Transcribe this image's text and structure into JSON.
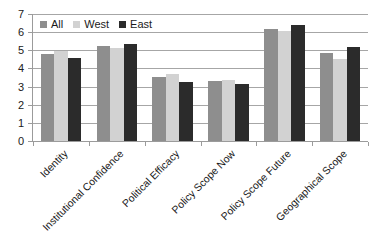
{
  "chart_data": {
    "type": "bar",
    "title": "",
    "subtitle": "",
    "xlabel": "",
    "ylabel": "",
    "ylim": [
      0,
      7
    ],
    "ytick_step": 1,
    "yticks": [
      "7",
      "6",
      "5",
      "4",
      "3",
      "2",
      "1",
      "0"
    ],
    "grid": true,
    "grid_axis": "y",
    "legend_position": "top-left-inside",
    "categories": [
      "Identity",
      "Institutional Confidence",
      "Political Efficacy",
      "Policy Scope Now",
      "Policy Scope Future",
      "Geographical Scope"
    ],
    "series": [
      {
        "name": "All",
        "color": "#8e8e8e",
        "values": [
          4.8,
          5.25,
          3.55,
          3.3,
          6.2,
          4.85
        ]
      },
      {
        "name": "West",
        "color": "#d2d2d2",
        "values": [
          4.95,
          5.15,
          3.7,
          3.38,
          6.05,
          4.5
        ]
      },
      {
        "name": "East",
        "color": "#2b2b2b",
        "values": [
          4.55,
          5.35,
          3.25,
          3.12,
          6.4,
          5.2
        ]
      }
    ]
  },
  "legend": {
    "items": [
      {
        "label": "All",
        "color": "#8e8e8e"
      },
      {
        "label": "West",
        "color": "#d2d2d2"
      },
      {
        "label": "East",
        "color": "#2b2b2b"
      }
    ]
  },
  "colors": {
    "series_all": "#8e8e8e",
    "series_west": "#d2d2d2",
    "series_east": "#2b2b2b",
    "gridline": "#a6a6a6",
    "axis": "#9b9b9b",
    "text": "#1a1a1a",
    "background": "#ffffff"
  }
}
